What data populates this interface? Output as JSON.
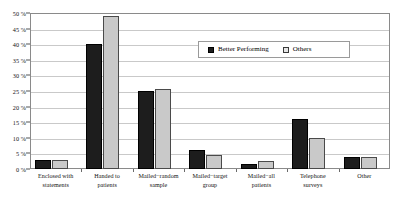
{
  "chart_data": {
    "type": "bar",
    "title": "",
    "subtitle": "",
    "xlabel": "",
    "ylabel": "",
    "ylim": [
      0,
      50
    ],
    "ytick_values": [
      0,
      5,
      10,
      15,
      20,
      25,
      30,
      35,
      40,
      45,
      50
    ],
    "ytick_labels": [
      "0 %",
      "5 %",
      "10 %",
      "15 %",
      "20 %",
      "25 %",
      "30 %",
      "35 %",
      "40 %",
      "45 %",
      "50 %"
    ],
    "grid": true,
    "legend_position": "inside-top-right",
    "categories": [
      "Enclosed with statements",
      "Handed to patients",
      "Mailed−random sample",
      "Mailed−target group",
      "Mailed−all patients",
      "Telephone surveys",
      "Other"
    ],
    "category_lines": [
      [
        "Enclosed with",
        "statements"
      ],
      [
        "Handed to",
        "patients"
      ],
      [
        "Mailed−random",
        "sample"
      ],
      [
        "Mailed−target",
        "group"
      ],
      [
        "Mailed−all",
        "patients"
      ],
      [
        "Telephone",
        "surveys"
      ],
      [
        "Other"
      ]
    ],
    "series": [
      {
        "name": "Better Performing",
        "color": "#1d1d1d",
        "values": [
          3,
          40,
          25,
          6,
          1.5,
          16,
          4
        ]
      },
      {
        "name": "Others",
        "color": "#c9c9c9",
        "values": [
          3,
          49,
          25.5,
          4.5,
          2.5,
          10,
          4
        ]
      }
    ]
  },
  "legend": {
    "entries": [
      {
        "label": "Better Performing",
        "swatch": "dark"
      },
      {
        "label": "Others",
        "swatch": "light"
      }
    ]
  },
  "colors": {
    "better_performing": "#1d1d1d",
    "others": "#c9c9c9",
    "gridline": "#c9c9c9",
    "frame": "#8a8a8a",
    "text": "#111111",
    "background": "#ffffff"
  }
}
